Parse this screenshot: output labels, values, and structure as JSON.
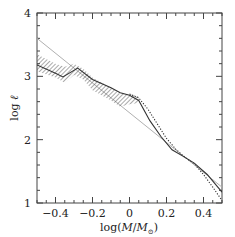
{
  "chart_data": {
    "type": "line",
    "title": "",
    "xlabel": "log(M/M⊙)",
    "ylabel": "log ℓ",
    "xlim": [
      -0.5,
      0.5
    ],
    "ylim": [
      1,
      4
    ],
    "grid": false,
    "legend": null,
    "x_ticks": [
      -0.4,
      -0.2,
      0,
      0.2,
      0.4
    ],
    "x_tick_labels": [
      "−0.4",
      "−0.2",
      "0",
      "0.2",
      "0.4"
    ],
    "y_ticks": [
      1,
      2,
      3,
      4
    ],
    "y_tick_labels": [
      "1",
      "2",
      "3",
      "4"
    ],
    "series": [
      {
        "name": "reference power law",
        "style": "light gray solid line",
        "color": "#b0b0b0",
        "x": [
          -0.5,
          0.5
        ],
        "y": [
          3.6,
          1.25
        ]
      },
      {
        "name": "hatched uncertainty band",
        "style": "diagonal hatching",
        "color": "#555555",
        "x": [
          -0.5,
          -0.4,
          -0.35,
          -0.3,
          -0.25,
          -0.2,
          -0.1,
          -0.05,
          0.0,
          0.05
        ],
        "y_upper": [
          3.35,
          3.2,
          3.15,
          3.2,
          3.12,
          2.98,
          2.82,
          2.72,
          2.72,
          2.68
        ],
        "y_lower": [
          3.08,
          2.98,
          2.9,
          3.02,
          2.95,
          2.78,
          2.62,
          2.52,
          2.56,
          2.58
        ]
      },
      {
        "name": "solid curve",
        "style": "dark solid line",
        "color": "#333333",
        "x": [
          -0.5,
          -0.4,
          -0.36,
          -0.28,
          -0.2,
          -0.1,
          -0.05,
          0.0,
          0.05,
          0.11,
          0.17,
          0.23,
          0.3,
          0.35,
          0.42,
          0.5
        ],
        "y": [
          3.18,
          3.05,
          2.99,
          3.13,
          2.95,
          2.82,
          2.74,
          2.7,
          2.62,
          2.3,
          2.05,
          1.84,
          1.72,
          1.63,
          1.45,
          1.17
        ]
      },
      {
        "name": "dotted curve",
        "style": "dark dotted line",
        "color": "#333333",
        "x": [
          0.0,
          0.05,
          0.1,
          0.15,
          0.2,
          0.25,
          0.3,
          0.35,
          0.4,
          0.45,
          0.5
        ],
        "y": [
          2.72,
          2.66,
          2.48,
          2.25,
          2.02,
          1.85,
          1.72,
          1.62,
          1.45,
          1.25,
          1.04
        ]
      }
    ]
  },
  "axes": {
    "x_label_main": "log(",
    "x_label_M": "M",
    "x_label_slash": "/",
    "x_label_Msun": "M",
    "x_label_sub": "⊙",
    "x_label_close": ")",
    "y_label_main": "log ",
    "y_label_ell": "ℓ"
  }
}
